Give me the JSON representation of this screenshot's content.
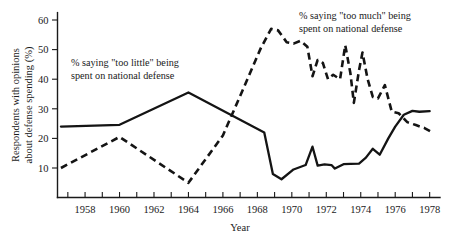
{
  "chart_data": {
    "type": "line",
    "title": "",
    "subtitle": "",
    "xlabel": "Year",
    "ylabel": "Respondents with opinions about defense spending (%)",
    "ylabel_line1": "Respondents with opinions",
    "ylabel_line2": "about defense spending (%)",
    "xlim": [
      1956.4,
      1978.6
    ],
    "ylim": [
      0,
      63
    ],
    "grid": false,
    "legend_position": "inline-annotations",
    "y_ticks": [
      10,
      20,
      30,
      40,
      50,
      60
    ],
    "y_tick_labels": [
      "10",
      "20",
      "30",
      "40",
      "50",
      "60"
    ],
    "x_ticks": [
      1957,
      1958,
      1959,
      1960,
      1961,
      1962,
      1963,
      1964,
      1965,
      1966,
      1967,
      1968,
      1969,
      1970,
      1971,
      1972,
      1973,
      1974,
      1975,
      1976,
      1977,
      1978
    ],
    "x_tick_labels_shown": [
      "1958",
      "1960",
      "1962",
      "1964",
      "1966",
      "1968",
      "1970",
      "1972",
      "1974",
      "1976",
      "1978"
    ],
    "x_labeled_ticks": [
      1958,
      1960,
      1962,
      1964,
      1966,
      1968,
      1970,
      1972,
      1974,
      1976,
      1978
    ],
    "series": [
      {
        "name": "% saying \"too little\" being spent on national defense",
        "style": "solid",
        "color": "#141414",
        "x": [
          1956.6,
          1960.0,
          1964.0,
          1968.4,
          1968.9,
          1969.4,
          1970.1,
          1970.8,
          1971.2,
          1971.5,
          1971.9,
          1972.3,
          1972.5,
          1973.0,
          1973.4,
          1973.9,
          1974.3,
          1974.7,
          1975.1,
          1975.6,
          1976.0,
          1976.5,
          1977.0,
          1977.4,
          1978.0
        ],
        "y": [
          24.0,
          24.6,
          35.5,
          22.0,
          8.0,
          6.2,
          9.5,
          11.0,
          17.2,
          10.8,
          11.2,
          11.0,
          9.8,
          11.3,
          11.4,
          11.5,
          13.5,
          16.5,
          14.5,
          20.0,
          24.0,
          28.0,
          29.3,
          29.0,
          29.2
        ]
      },
      {
        "name": "% saying \"too much\" being spent on national defense",
        "style": "dashed",
        "color": "#141414",
        "x": [
          1956.6,
          1960.0,
          1964.0,
          1966.0,
          1967.2,
          1968.2,
          1968.8,
          1969.2,
          1969.7,
          1970.1,
          1970.5,
          1970.9,
          1971.2,
          1971.5,
          1971.8,
          1972.1,
          1972.4,
          1972.8,
          1973.1,
          1973.4,
          1973.6,
          1973.9,
          1974.1,
          1974.4,
          1974.7,
          1975.0,
          1975.4,
          1975.8,
          1976.2,
          1976.7,
          1977.2,
          1977.7,
          1978.1
        ],
        "y": [
          10.0,
          20.5,
          5.0,
          21.0,
          37.0,
          50.5,
          57.0,
          56.5,
          52.5,
          52.0,
          53.0,
          51.0,
          41.0,
          46.5,
          45.5,
          40.0,
          41.5,
          40.0,
          51.5,
          42.0,
          32.0,
          43.0,
          49.0,
          40.0,
          34.0,
          33.5,
          38.0,
          29.0,
          28.5,
          25.5,
          24.5,
          23.5,
          22.2
        ]
      }
    ],
    "annotations": [
      {
        "name": "too-little-annotation",
        "line1": "% saying \"too little\" being",
        "line2": "spent on national defense",
        "x_px": 71,
        "y_px": 66
      },
      {
        "name": "too-much-annotation",
        "line1": "% saying \"too much\" being",
        "line2": "spent on national defense",
        "x_px": 299,
        "y_px": 19
      }
    ]
  }
}
